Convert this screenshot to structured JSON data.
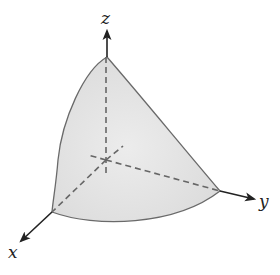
{
  "diagram": {
    "type": "3d-solid-octant",
    "axes": {
      "z": {
        "label": "z"
      },
      "y": {
        "label": "y"
      },
      "x": {
        "label": "x"
      }
    },
    "colors": {
      "surface_fill": "#e2e2e2",
      "surface_edge": "#6a6a6a",
      "axis": "#222222",
      "hidden_line": "#666666"
    }
  }
}
